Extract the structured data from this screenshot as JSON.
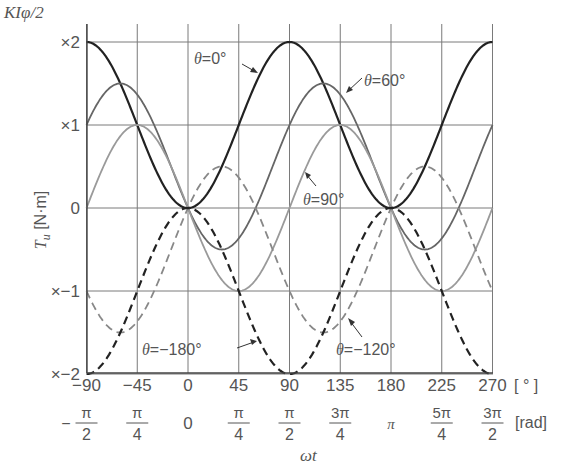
{
  "chart_data": {
    "type": "line",
    "title": "",
    "ylabel": "T_u [N·m]",
    "ylabel_unit_label": "KIφ/2",
    "xlabel": "ωt",
    "x_unit_deg": "[ ° ]",
    "x_unit_rad": "[rad]",
    "xlim": [
      -90,
      270
    ],
    "ylim": [
      -2,
      2
    ],
    "grid": true,
    "x_ticks_deg": [
      "-90",
      "-45",
      "0",
      "45",
      "90",
      "135",
      "180",
      "225",
      "270"
    ],
    "x_ticks_rad": [
      {
        "num": "π",
        "den": "2",
        "prefix": "−"
      },
      {
        "num": "π",
        "den": "4",
        "prefix": ""
      },
      {
        "num": "0",
        "den": "",
        "prefix": ""
      },
      {
        "num": "π",
        "den": "4",
        "prefix": ""
      },
      {
        "num": "π",
        "den": "2",
        "prefix": ""
      },
      {
        "num": "3π",
        "den": "4",
        "prefix": ""
      },
      {
        "num": "π",
        "den": "",
        "prefix": ""
      },
      {
        "num": "5π",
        "den": "4",
        "prefix": ""
      },
      {
        "num": "3π",
        "den": "2",
        "prefix": ""
      }
    ],
    "y_ticks": [
      {
        "value": 2,
        "label": "×2"
      },
      {
        "value": 1,
        "label": "×1"
      },
      {
        "value": 0,
        "label": "0"
      },
      {
        "value": -1,
        "label": "×−1"
      },
      {
        "value": -2,
        "label": "×−2"
      }
    ],
    "formula": "T_u = cos θ − cos(2ωt − θ)  (in units of KIφ/2)",
    "x": [
      -90,
      -67.5,
      -45,
      -22.5,
      0,
      22.5,
      45,
      67.5,
      90,
      112.5,
      135,
      157.5,
      180,
      202.5,
      225,
      247.5,
      270
    ],
    "series": [
      {
        "name": "θ=0°",
        "theta": 0,
        "style": "solid",
        "color": "#222222",
        "values": [
          2,
          1.71,
          1,
          0.29,
          0,
          0.29,
          1,
          1.71,
          2,
          1.71,
          1,
          0.29,
          0,
          0.29,
          1,
          1.71,
          2
        ]
      },
      {
        "name": "θ=60°",
        "theta": 60,
        "style": "solid",
        "color": "#666666",
        "values": [
          1,
          1.37,
          1.5,
          1.37,
          0,
          -0.37,
          -0.5,
          -0.37,
          1,
          1.37,
          1.5,
          1.37,
          0,
          -0.37,
          -0.5,
          -0.37,
          1
        ]
      },
      {
        "name": "θ=90°",
        "theta": 90,
        "style": "solid",
        "color": "#9a9a9a",
        "values": [
          0,
          0.71,
          1,
          0.71,
          0,
          -0.71,
          -1,
          -0.71,
          0,
          0.71,
          1,
          0.71,
          0,
          -0.71,
          -1,
          -0.71,
          0
        ]
      },
      {
        "name": "θ=−120°",
        "theta": -120,
        "style": "dashed",
        "color": "#888888",
        "values": [
          -1,
          -1.47,
          -1.37,
          -0.47,
          0,
          0.47,
          0.37,
          -0.13,
          -1,
          -1.47,
          -1.37,
          -0.47,
          0,
          0.47,
          0.37,
          -0.13,
          -1
        ]
      },
      {
        "name": "θ=−180°",
        "theta": -180,
        "style": "dashed",
        "color": "#222222",
        "values": [
          -2,
          -1.71,
          -1,
          -0.29,
          0,
          -0.29,
          -1,
          -1.71,
          -2,
          -1.71,
          -1,
          -0.29,
          0,
          -0.29,
          -1,
          -1.71,
          -2
        ]
      }
    ],
    "annotations": [
      {
        "text": "θ=0°",
        "theta_sym": "θ",
        "rest": "=0°"
      },
      {
        "text": "θ=60°",
        "theta_sym": "θ",
        "rest": "=60°"
      },
      {
        "text": "θ=90°",
        "theta_sym": "θ",
        "rest": "=90°"
      },
      {
        "text": "θ=−180°",
        "theta_sym": "θ",
        "rest": "=−180°"
      },
      {
        "text": "θ=−120°",
        "theta_sym": "θ",
        "rest": "=−120°"
      }
    ]
  },
  "labels": {
    "y_unit": "KIφ/2",
    "y_axis_T": "T",
    "y_axis_sub": "u",
    "y_axis_unit": " [N·m]",
    "x_axis": "ωt",
    "deg_unit": "[ ° ]",
    "rad_unit": "[rad]",
    "theta": "θ",
    "ann_0": "=0°",
    "ann_60": "=60°",
    "ann_90": "=90°",
    "ann_m180": "=−180°",
    "ann_m120": "=−120°"
  }
}
